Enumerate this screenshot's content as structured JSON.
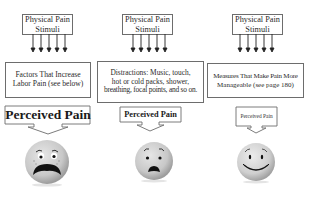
{
  "columns": [
    {
      "stimulus_label": "Physical Pain\nStimuli",
      "stimulus_line1": "Physical Pain",
      "stimulus_line2": "Stimuli",
      "modifier_line1": "Factors That Increase",
      "modifier_line2": "Labor Pain (see below)",
      "modifier_line3": "",
      "perceived_label": "Perceived Pain",
      "face": "distressed-face-icon"
    },
    {
      "stimulus_line1": "Physical Pain",
      "stimulus_line2": "Stimuli",
      "modifier_line1": "Distractions: Music, touch,",
      "modifier_line2": "hot or cold packs, shower,",
      "modifier_line3": "breathing, focal points, and so on.",
      "perceived_label": "Perceived Pain",
      "face": "worried-face-icon"
    },
    {
      "stimulus_line1": "Physical Pain",
      "stimulus_line2": "Stimuli",
      "modifier_line1": "Measures That Make Pain More",
      "modifier_line2": "Manageable (see page 180)",
      "modifier_line3": "",
      "perceived_label": "Perceived Pain",
      "face": "smiling-face-icon"
    }
  ],
  "colors": {
    "border": "#6d6d6d",
    "face_fill": "#cfcfcf",
    "face_shadow": "#9e9e9e",
    "feature": "#1a1a1a"
  }
}
